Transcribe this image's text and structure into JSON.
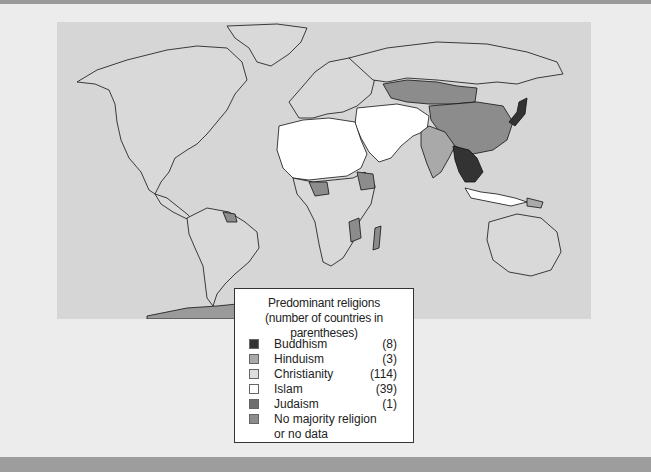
{
  "map": {
    "ocean_color": "#d6d6d6",
    "land_colors": {
      "buddhism": "#333333",
      "hinduism": "#a9a9a9",
      "christianity": "#d9d9d9",
      "islam": "#ffffff",
      "judaism": "#6e6e6e",
      "none": "#8c8c8c"
    }
  },
  "legend": {
    "title_line1": "Predominant religions",
    "title_line2": "(number of countries in parentheses)",
    "items": [
      {
        "label": "Buddhism",
        "count": "(8)",
        "color": "#333333"
      },
      {
        "label": "Hinduism",
        "count": "(3)",
        "color": "#a9a9a9"
      },
      {
        "label": "Christianity",
        "count": "(114)",
        "color": "#dedede"
      },
      {
        "label": "Islam",
        "count": "(39)",
        "color": "#ffffff"
      },
      {
        "label": "Judaism",
        "count": "(1)",
        "color": "#6e6e6e"
      },
      {
        "label": "No majority religion",
        "count": "",
        "color": "#8c8c8c"
      },
      {
        "label": "or no data",
        "count": "",
        "color": ""
      }
    ]
  }
}
